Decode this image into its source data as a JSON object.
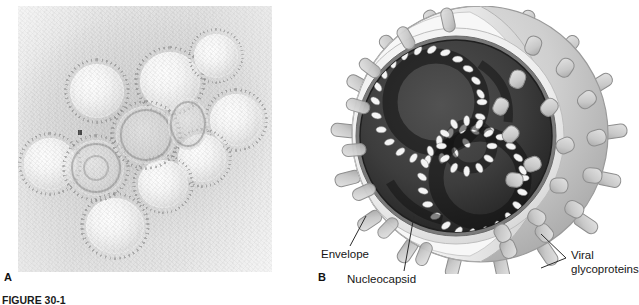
{
  "figure": {
    "caption": "FIGURE 30-1",
    "panels": [
      {
        "letter": "A",
        "kind": "electron-micrograph",
        "description": "Negative-stain transmission electron micrograph of a cluster of spherical enveloped virions with surface spikes"
      },
      {
        "letter": "B",
        "kind": "schematic-diagram",
        "description": "Cutaway schematic of an enveloped virus particle revealing the coiled helical nucleocapsid"
      }
    ]
  },
  "labels": {
    "envelope": "Envelope",
    "nucleocapsid": "Nucleocapsid",
    "glycoproteins_line1": "Viral",
    "glycoproteins_line2": "glycoproteins"
  },
  "colors": {
    "page_background": "#ffffff",
    "text": "#1a1a1a",
    "micrograph_light": "#efefef",
    "micrograph_mid": "#dcdcdc",
    "envelope_outer": "#c9c9c9",
    "envelope_inner": "#efefef",
    "spike_fill": "#d2d2d2",
    "spike_stroke": "#8d8d8d",
    "interior_dark": "#3a3a3a",
    "interior_darkest": "#2a2a2a",
    "capsomere_light": "#f2f2f2",
    "leader_line": "#2b2b2b"
  }
}
